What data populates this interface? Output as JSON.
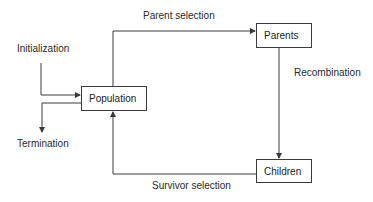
{
  "diagram": {
    "type": "flowchart",
    "title": "",
    "nodes": [
      {
        "id": "population",
        "label": "Population"
      },
      {
        "id": "parents",
        "label": "Parents"
      },
      {
        "id": "children",
        "label": "Children"
      }
    ],
    "terminals": {
      "initialization": "Initialization",
      "termination": "Termination"
    },
    "edges": [
      {
        "from": "initialization",
        "to": "population",
        "label": ""
      },
      {
        "from": "population",
        "to": "parents",
        "label": "Parent selection"
      },
      {
        "from": "parents",
        "to": "children",
        "label": "Recombination"
      },
      {
        "from": "children",
        "to": "population",
        "label": "Survivor selection"
      },
      {
        "from": "population",
        "to": "termination",
        "label": ""
      }
    ],
    "colors": {
      "line": "#3a3a3a",
      "text": "#2a2a2a",
      "background": "#ffffff"
    }
  }
}
